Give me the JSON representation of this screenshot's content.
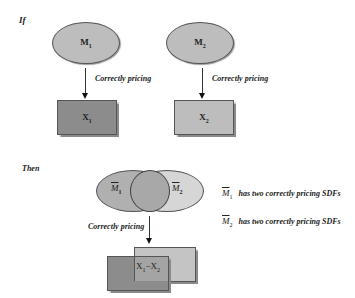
{
  "if_section": {
    "heading": "If",
    "left": {
      "ellipse_label": "M",
      "ellipse_sub": "1",
      "arrow_label": "Correctly pricing",
      "rect_label": "X",
      "rect_sub": "1",
      "rect_color": "#8c8c8c"
    },
    "right": {
      "ellipse_label": "M",
      "ellipse_sub": "2",
      "arrow_label": "Correctly pricing",
      "rect_label": "X",
      "rect_sub": "2",
      "rect_color": "#bdbdbd"
    },
    "ellipse_color": "#bdbdbd"
  },
  "then_section": {
    "heading": "Then",
    "venn": {
      "left_label": "M",
      "left_sub": "1",
      "right_label": "M",
      "right_sub": "2"
    },
    "arrow_label": "Correctly pricing",
    "overlap_label": "X",
    "overlap_sub1": "1",
    "overlap_mid": "−X",
    "overlap_sub2": "2",
    "notes": [
      {
        "label": "M",
        "sub": "1",
        "text": "has two correctly pricing SDFs"
      },
      {
        "label": "M",
        "sub": "2",
        "text": "has two correctly pricing SDFs"
      }
    ]
  }
}
